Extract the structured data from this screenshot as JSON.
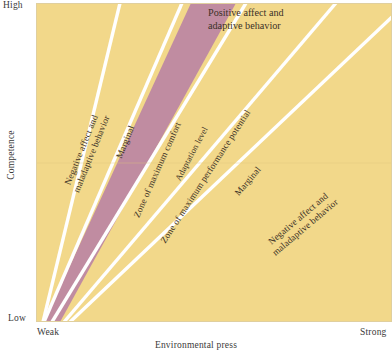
{
  "figure": {
    "type": "conceptual-wedge-diagram"
  },
  "axes": {
    "y": {
      "title": "Competence",
      "high_label": "High",
      "low_label": "Low"
    },
    "x": {
      "title": "Environmental press",
      "low_label": "Weak",
      "high_label": "Strong"
    }
  },
  "colors": {
    "background_zone": "#f2d88a",
    "comfort_zone": "#c08ca1",
    "divider_line": "#ffffff",
    "plot_border": "#e9d7a4",
    "text": "#3b3127",
    "axis_text": "#3a3a3a"
  },
  "bands": [
    {
      "id": "negative-left",
      "label": "Negative affect and\nmaladaptive behavior",
      "line1": "Negative affect and",
      "line2": "maladaptive behavior",
      "fill": "#f2d88a",
      "orientation": "rotated"
    },
    {
      "id": "marginal-left",
      "label": "Marginal",
      "fill": "#f2d88a",
      "orientation": "rotated"
    },
    {
      "id": "zone-maximum-comfort",
      "label": "Zone of maximum comfort",
      "fill": "#c08ca1",
      "orientation": "rotated"
    },
    {
      "id": "adaptation-level",
      "label": "Adaptation level",
      "fill": "#c08ca1",
      "orientation": "rotated"
    },
    {
      "id": "zone-maximum-performance",
      "label": "Zone of maximum performance potential",
      "fill": "#f2d88a",
      "orientation": "rotated"
    },
    {
      "id": "marginal-right",
      "label": "Marginal",
      "fill": "#f2d88a",
      "orientation": "rotated"
    },
    {
      "id": "negative-right",
      "label": "Negative affect and\nmaladaptive behavior",
      "line1": "Negative affect and",
      "line2": "maladaptive behavior",
      "fill": "#f2d88a",
      "orientation": "rotated"
    }
  ],
  "callouts": [
    {
      "id": "positive-affect",
      "line1": "Positive affect and",
      "line2": "adaptive behavior"
    }
  ]
}
